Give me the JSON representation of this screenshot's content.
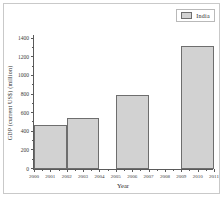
{
  "chart_data": {
    "type": "bar",
    "title": "",
    "xlabel": "Year",
    "ylabel": "GDP (current US$) (million)",
    "legend": [
      {
        "name": "India",
        "color": "#d2d2d2"
      }
    ],
    "legend_position": "top-right",
    "grid": false,
    "xlim": [
      2000,
      2011
    ],
    "ylim": [
      0,
      1450
    ],
    "y_ticks": [
      0,
      200,
      400,
      600,
      800,
      1000,
      1200,
      1400
    ],
    "y_tick_labels": [
      "0",
      "200",
      "400",
      "600",
      "800",
      "1000",
      "1200",
      "1400"
    ],
    "x_ticks": [
      2000,
      2001,
      2002,
      2003,
      2004,
      2005,
      2006,
      2007,
      2008,
      2009,
      2010,
      2011
    ],
    "x_tick_labels": [
      "2000",
      "2001",
      "2002",
      "2003",
      "2004",
      "2005",
      "2006",
      "2007",
      "2008",
      "2009",
      "2010",
      "2011"
    ],
    "categories": [
      "2000-2002",
      "2002-2004",
      "2005-2007",
      "2009-2011"
    ],
    "values": [
      478,
      550,
      800,
      1318
    ],
    "bars": [
      {
        "label": "2000-2002",
        "x_start": 2000,
        "x_end": 2002,
        "value": 478
      },
      {
        "label": "2002-2004",
        "x_start": 2002,
        "x_end": 2004,
        "value": 550
      },
      {
        "label": "2005-2007",
        "x_start": 2005,
        "x_end": 2007,
        "value": 800
      },
      {
        "label": "2009-2011",
        "x_start": 2009,
        "x_end": 2011,
        "value": 1318
      }
    ],
    "series": [
      {
        "name": "India",
        "values": [
          478,
          550,
          800,
          1318
        ]
      }
    ]
  },
  "figure": {
    "background_color": "#ffffff",
    "frame_color": "#c9c9c9",
    "axis_color": "#5a5a5a",
    "bar_fill": "#d2d2d2",
    "bar_edge": "#6e6e6e"
  }
}
